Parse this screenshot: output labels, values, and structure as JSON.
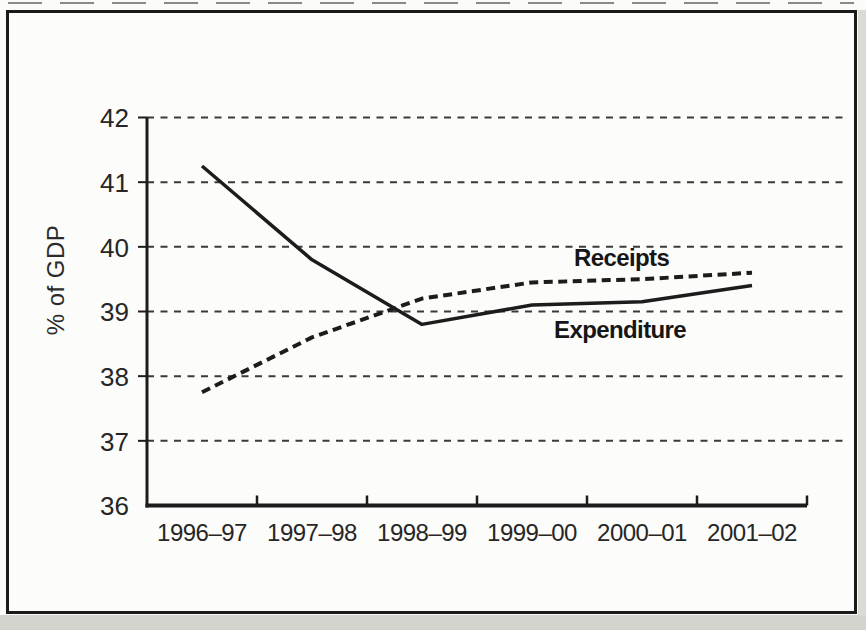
{
  "chart_data": {
    "type": "line",
    "title": "",
    "xlabel": "",
    "ylabel": "% of GDP",
    "categories": [
      "1996–97",
      "1997–98",
      "1998–99",
      "1999–00",
      "2000–01",
      "2001–02"
    ],
    "yticks": [
      36,
      37,
      38,
      39,
      40,
      41,
      42
    ],
    "ylim": [
      36,
      42
    ],
    "grid": "horizontal-dashed",
    "legend_position": "inline-annotations",
    "series": [
      {
        "name": "Receipts",
        "style": "dashed",
        "values": [
          37.75,
          38.6,
          39.2,
          39.45,
          39.5,
          39.6
        ]
      },
      {
        "name": "Expenditure",
        "style": "solid",
        "values": [
          41.25,
          39.8,
          38.8,
          39.1,
          39.15,
          39.4
        ]
      }
    ],
    "ink_color": "#1c1c1c",
    "grid_color": "#3a3a3a",
    "background_color": "#fcfcfa"
  }
}
